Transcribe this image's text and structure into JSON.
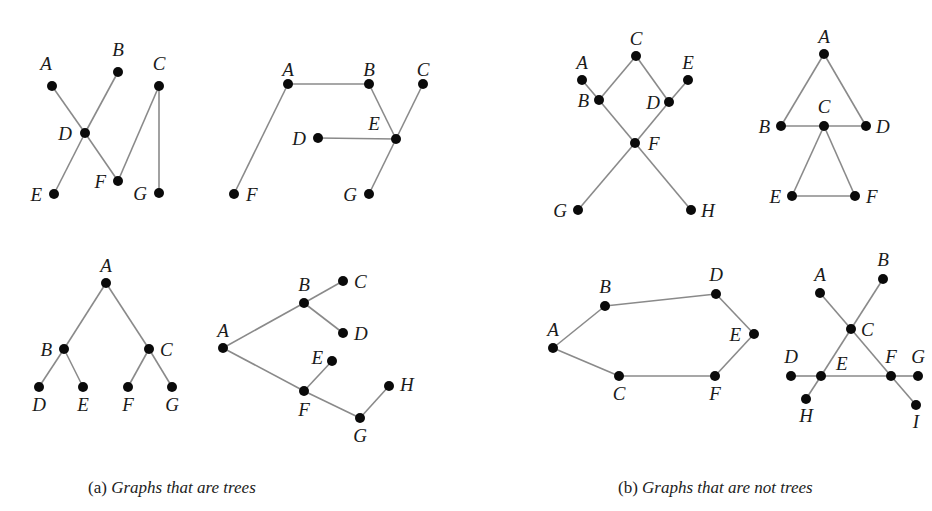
{
  "captions": {
    "a": {
      "prefix": "(a) ",
      "text": "Graphs that are trees",
      "x": 88
    },
    "b": {
      "prefix": "(b) ",
      "text": "Graphs that are not trees",
      "x": 618
    }
  },
  "graphs": [
    {
      "id": "tree-1",
      "group": "a",
      "nodes": [
        {
          "id": "A",
          "x": 52,
          "y": 86,
          "lx": 46,
          "ly": 70,
          "anchor": "middle"
        },
        {
          "id": "B",
          "x": 118,
          "y": 72,
          "lx": 118,
          "ly": 56,
          "anchor": "middle"
        },
        {
          "id": "C",
          "x": 159,
          "y": 86,
          "lx": 159,
          "ly": 70,
          "anchor": "middle"
        },
        {
          "id": "D",
          "x": 85,
          "y": 133,
          "lx": 72,
          "ly": 140,
          "anchor": "end"
        },
        {
          "id": "E",
          "x": 54,
          "y": 194,
          "lx": 42,
          "ly": 201,
          "anchor": "end"
        },
        {
          "id": "F",
          "x": 118,
          "y": 181,
          "lx": 106,
          "ly": 188,
          "anchor": "end"
        },
        {
          "id": "G",
          "x": 159,
          "y": 193,
          "lx": 147,
          "ly": 200,
          "anchor": "end"
        }
      ],
      "edges": [
        [
          "A",
          "D"
        ],
        [
          "D",
          "F"
        ],
        [
          "B",
          "D"
        ],
        [
          "D",
          "E"
        ],
        [
          "F",
          "C"
        ],
        [
          "C",
          "G"
        ]
      ]
    },
    {
      "id": "tree-2",
      "group": "a",
      "nodes": [
        {
          "id": "A",
          "x": 288,
          "y": 84,
          "lx": 288,
          "ly": 76,
          "anchor": "middle"
        },
        {
          "id": "B",
          "x": 369,
          "y": 84,
          "lx": 369,
          "ly": 76,
          "anchor": "middle"
        },
        {
          "id": "C",
          "x": 423,
          "y": 84,
          "lx": 423,
          "ly": 76,
          "anchor": "middle"
        },
        {
          "id": "D",
          "x": 318,
          "y": 138,
          "lx": 306,
          "ly": 145,
          "anchor": "end"
        },
        {
          "id": "E",
          "x": 396,
          "y": 139,
          "lx": 374,
          "ly": 130,
          "anchor": "middle"
        },
        {
          "id": "F",
          "x": 234,
          "y": 194,
          "lx": 246,
          "ly": 201,
          "anchor": "start"
        },
        {
          "id": "G",
          "x": 369,
          "y": 194,
          "lx": 357,
          "ly": 201,
          "anchor": "end"
        }
      ],
      "edges": [
        [
          "A",
          "B"
        ],
        [
          "A",
          "F"
        ],
        [
          "B",
          "E"
        ],
        [
          "D",
          "E"
        ],
        [
          "E",
          "C"
        ],
        [
          "E",
          "G"
        ]
      ]
    },
    {
      "id": "tree-3",
      "group": "a",
      "nodes": [
        {
          "id": "A",
          "x": 106,
          "y": 283,
          "lx": 106,
          "ly": 272,
          "anchor": "middle"
        },
        {
          "id": "B",
          "x": 64,
          "y": 349,
          "lx": 52,
          "ly": 356,
          "anchor": "end"
        },
        {
          "id": "C",
          "x": 149,
          "y": 349,
          "lx": 160,
          "ly": 356,
          "anchor": "start"
        },
        {
          "id": "D",
          "x": 39,
          "y": 387,
          "lx": 39,
          "ly": 411,
          "anchor": "middle"
        },
        {
          "id": "E",
          "x": 83,
          "y": 387,
          "lx": 83,
          "ly": 411,
          "anchor": "middle"
        },
        {
          "id": "F",
          "x": 128,
          "y": 387,
          "lx": 128,
          "ly": 411,
          "anchor": "middle"
        },
        {
          "id": "G",
          "x": 172,
          "y": 387,
          "lx": 172,
          "ly": 411,
          "anchor": "middle"
        }
      ],
      "edges": [
        [
          "A",
          "B"
        ],
        [
          "A",
          "C"
        ],
        [
          "B",
          "D"
        ],
        [
          "B",
          "E"
        ],
        [
          "C",
          "F"
        ],
        [
          "C",
          "G"
        ]
      ]
    },
    {
      "id": "tree-4",
      "group": "a",
      "nodes": [
        {
          "id": "A",
          "x": 223,
          "y": 348,
          "lx": 223,
          "ly": 337,
          "anchor": "middle"
        },
        {
          "id": "B",
          "x": 304,
          "y": 303,
          "lx": 304,
          "ly": 291,
          "anchor": "middle"
        },
        {
          "id": "C",
          "x": 343,
          "y": 281,
          "lx": 354,
          "ly": 288,
          "anchor": "start"
        },
        {
          "id": "D",
          "x": 343,
          "y": 333,
          "lx": 354,
          "ly": 340,
          "anchor": "start"
        },
        {
          "id": "E",
          "x": 332,
          "y": 361,
          "lx": 323,
          "ly": 364,
          "anchor": "end"
        },
        {
          "id": "F",
          "x": 304,
          "y": 391,
          "lx": 304,
          "ly": 416,
          "anchor": "middle"
        },
        {
          "id": "G",
          "x": 360,
          "y": 418,
          "lx": 360,
          "ly": 442,
          "anchor": "middle"
        },
        {
          "id": "H",
          "x": 389,
          "y": 386,
          "lx": 400,
          "ly": 391,
          "anchor": "start"
        }
      ],
      "edges": [
        [
          "A",
          "B"
        ],
        [
          "B",
          "C"
        ],
        [
          "B",
          "D"
        ],
        [
          "A",
          "F"
        ],
        [
          "F",
          "E"
        ],
        [
          "F",
          "G"
        ],
        [
          "G",
          "H"
        ]
      ]
    },
    {
      "id": "nontree-1",
      "group": "b",
      "nodes": [
        {
          "id": "C",
          "x": 636,
          "y": 56,
          "lx": 636,
          "ly": 45,
          "anchor": "middle"
        },
        {
          "id": "A",
          "x": 582,
          "y": 80,
          "lx": 582,
          "ly": 69,
          "anchor": "middle"
        },
        {
          "id": "E",
          "x": 688,
          "y": 80,
          "lx": 688,
          "ly": 69,
          "anchor": "middle"
        },
        {
          "id": "B",
          "x": 599,
          "y": 100,
          "lx": 589,
          "ly": 107,
          "anchor": "end"
        },
        {
          "id": "D",
          "x": 669,
          "y": 102,
          "lx": 660,
          "ly": 109,
          "anchor": "end"
        },
        {
          "id": "F",
          "x": 635,
          "y": 143,
          "lx": 648,
          "ly": 150,
          "anchor": "start"
        },
        {
          "id": "G",
          "x": 578,
          "y": 210,
          "lx": 567,
          "ly": 217,
          "anchor": "end"
        },
        {
          "id": "H",
          "x": 691,
          "y": 210,
          "lx": 701,
          "ly": 217,
          "anchor": "start"
        }
      ],
      "edges": [
        [
          "A",
          "B"
        ],
        [
          "B",
          "C"
        ],
        [
          "C",
          "D"
        ],
        [
          "D",
          "E"
        ],
        [
          "B",
          "F"
        ],
        [
          "D",
          "F"
        ],
        [
          "F",
          "G"
        ],
        [
          "F",
          "H"
        ]
      ]
    },
    {
      "id": "nontree-2",
      "group": "b",
      "nodes": [
        {
          "id": "A",
          "x": 824,
          "y": 54,
          "lx": 824,
          "ly": 43,
          "anchor": "middle"
        },
        {
          "id": "B",
          "x": 781,
          "y": 126,
          "lx": 770,
          "ly": 133,
          "anchor": "end"
        },
        {
          "id": "C",
          "x": 824,
          "y": 126,
          "lx": 824,
          "ly": 113,
          "anchor": "middle"
        },
        {
          "id": "D",
          "x": 866,
          "y": 126,
          "lx": 876,
          "ly": 133,
          "anchor": "start"
        },
        {
          "id": "E",
          "x": 792,
          "y": 196,
          "lx": 781,
          "ly": 203,
          "anchor": "end"
        },
        {
          "id": "F",
          "x": 855,
          "y": 196,
          "lx": 866,
          "ly": 203,
          "anchor": "start"
        }
      ],
      "edges": [
        [
          "A",
          "B"
        ],
        [
          "A",
          "D"
        ],
        [
          "B",
          "C"
        ],
        [
          "C",
          "D"
        ],
        [
          "C",
          "E"
        ],
        [
          "C",
          "F"
        ],
        [
          "E",
          "F"
        ]
      ]
    },
    {
      "id": "nontree-3",
      "group": "b",
      "nodes": [
        {
          "id": "A",
          "x": 553,
          "y": 348,
          "lx": 553,
          "ly": 336,
          "anchor": "middle"
        },
        {
          "id": "B",
          "x": 605,
          "y": 306,
          "lx": 605,
          "ly": 293,
          "anchor": "middle"
        },
        {
          "id": "D",
          "x": 716,
          "y": 294,
          "lx": 716,
          "ly": 281,
          "anchor": "middle"
        },
        {
          "id": "E",
          "x": 754,
          "y": 334,
          "lx": 741,
          "ly": 341,
          "anchor": "end"
        },
        {
          "id": "F",
          "x": 715,
          "y": 376,
          "lx": 715,
          "ly": 400,
          "anchor": "middle"
        },
        {
          "id": "C",
          "x": 619,
          "y": 376,
          "lx": 619,
          "ly": 400,
          "anchor": "middle"
        }
      ],
      "edges": [
        [
          "A",
          "B"
        ],
        [
          "B",
          "D"
        ],
        [
          "D",
          "E"
        ],
        [
          "E",
          "F"
        ],
        [
          "F",
          "C"
        ],
        [
          "C",
          "A"
        ]
      ]
    },
    {
      "id": "nontree-4",
      "group": "b",
      "nodes": [
        {
          "id": "A",
          "x": 820,
          "y": 293,
          "lx": 820,
          "ly": 281,
          "anchor": "middle"
        },
        {
          "id": "B",
          "x": 883,
          "y": 279,
          "lx": 883,
          "ly": 266,
          "anchor": "middle"
        },
        {
          "id": "C",
          "x": 851,
          "y": 329,
          "lx": 861,
          "ly": 336,
          "anchor": "start"
        },
        {
          "id": "D",
          "x": 791,
          "y": 376,
          "lx": 791,
          "ly": 363,
          "anchor": "middle"
        },
        {
          "id": "E",
          "x": 821,
          "y": 376,
          "lx": 836,
          "ly": 370,
          "anchor": "start"
        },
        {
          "id": "F",
          "x": 891,
          "y": 376,
          "lx": 891,
          "ly": 363,
          "anchor": "middle"
        },
        {
          "id": "G",
          "x": 918,
          "y": 376,
          "lx": 918,
          "ly": 363,
          "anchor": "middle"
        },
        {
          "id": "H",
          "x": 806,
          "y": 399,
          "lx": 806,
          "ly": 422,
          "anchor": "middle"
        },
        {
          "id": "I",
          "x": 916,
          "y": 405,
          "lx": 916,
          "ly": 428,
          "anchor": "middle"
        }
      ],
      "edges": [
        [
          "A",
          "C"
        ],
        [
          "C",
          "F"
        ],
        [
          "F",
          "I"
        ],
        [
          "B",
          "C"
        ],
        [
          "C",
          "E"
        ],
        [
          "E",
          "H"
        ],
        [
          "D",
          "E"
        ],
        [
          "E",
          "F"
        ],
        [
          "F",
          "G"
        ]
      ]
    }
  ]
}
